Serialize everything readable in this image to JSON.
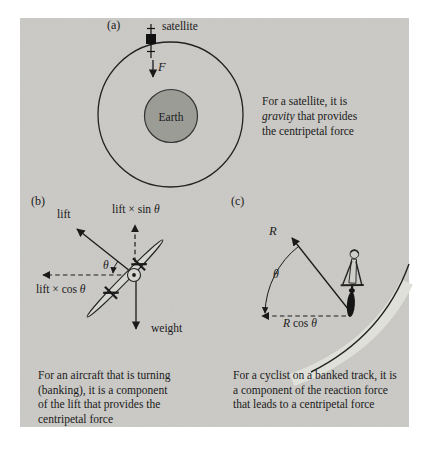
{
  "colors": {
    "page_bg": "#ffffff",
    "panel_bg": "#cac9c5",
    "ink": "#1f1f1f",
    "earth_fill": "#9c9c97",
    "aircraft_fill": "#d6d6d1",
    "track_band": "#e0e0da"
  },
  "figure": {
    "a": {
      "label": "(a)",
      "satellite_label": "satellite",
      "force_label": "F",
      "earth_label": "Earth",
      "caption": {
        "l1": "For a satellite, it is",
        "l2_italic": "gravity",
        "l2_rest": " that provides",
        "l3": "the centripetal force"
      }
    },
    "b": {
      "label": "(b)",
      "lift_label": "lift",
      "sin_prefix": "lift × sin ",
      "cos_prefix": "lift × cos ",
      "theta": "θ",
      "weight_label": "weight",
      "caption": {
        "l1": "For an aircraft that is turning",
        "l2": "(banking), it is a component",
        "l3": "of the lift that provides the",
        "l4": "centripetal force"
      }
    },
    "c": {
      "label": "(c)",
      "reaction_label": "R",
      "theta": "θ",
      "rcos_r": "R",
      "rcos_mid": " cos ",
      "rcos_theta": "θ",
      "caption": {
        "l1": "For a cyclist on a banked track, it is",
        "l2": "a component of the reaction force",
        "l3": "that leads to a centripetal force"
      }
    }
  }
}
